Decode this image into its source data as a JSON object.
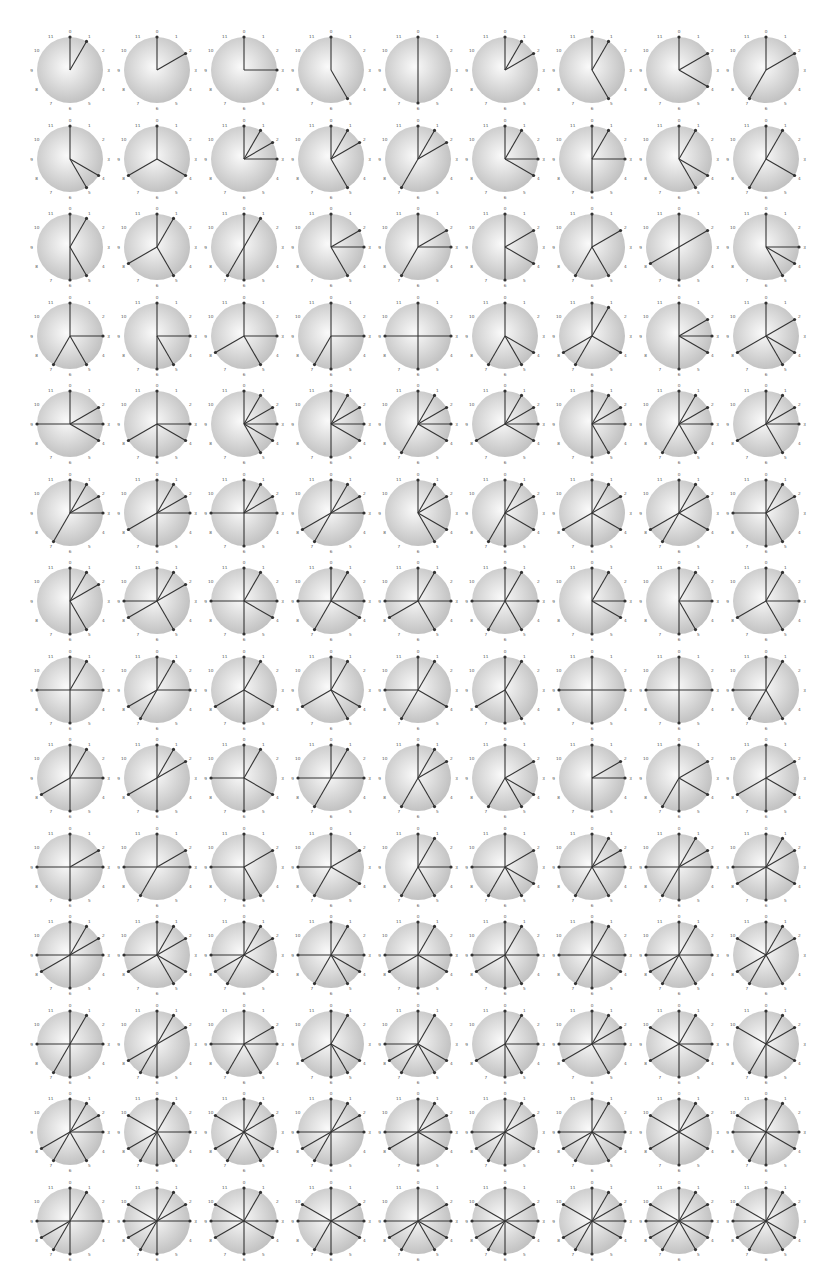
{
  "layout": {
    "columns": 9,
    "rows": 14,
    "first_center": [
      70,
      70
    ],
    "col_step": 87,
    "row_step": 88.5,
    "radius": 33
  },
  "colors": {
    "disc_center": "#fafafa",
    "disc_edge": "#bdbdbd",
    "spoke": "#333333",
    "label": "#555555"
  },
  "clock_labels": [
    "0",
    "1",
    "2",
    "3",
    "4",
    "5",
    "6",
    "7",
    "8",
    "9",
    "10",
    "11"
  ],
  "sets": [
    [
      0,
      1
    ],
    [
      0,
      2
    ],
    [
      0,
      3
    ],
    [
      0,
      5
    ],
    [
      0,
      6
    ],
    [
      0,
      1,
      2
    ],
    [
      0,
      1,
      5
    ],
    [
      0,
      2,
      4
    ],
    [
      0,
      2,
      7
    ],
    [
      0,
      4,
      5
    ],
    [
      0,
      4,
      8
    ],
    [
      0,
      1,
      2,
      3
    ],
    [
      0,
      1,
      2,
      5
    ],
    [
      0,
      1,
      2,
      7
    ],
    [
      0,
      1,
      3,
      4
    ],
    [
      0,
      1,
      3,
      6
    ],
    [
      0,
      1,
      4,
      5
    ],
    [
      0,
      1,
      4,
      7
    ],
    [
      0,
      1,
      5,
      6
    ],
    [
      0,
      1,
      5,
      8
    ],
    [
      0,
      1,
      6,
      7
    ],
    [
      0,
      2,
      3,
      5
    ],
    [
      0,
      2,
      3,
      7
    ],
    [
      0,
      2,
      4,
      6
    ],
    [
      0,
      2,
      5,
      7
    ],
    [
      0,
      2,
      6,
      8
    ],
    [
      0,
      3,
      4,
      5
    ],
    [
      0,
      3,
      5,
      7
    ],
    [
      0,
      3,
      5,
      6
    ],
    [
      0,
      3,
      5,
      8
    ],
    [
      0,
      3,
      6,
      7
    ],
    [
      0,
      3,
      6,
      9
    ],
    [
      0,
      4,
      5,
      7
    ],
    [
      0,
      1,
      4,
      7,
      8
    ],
    [
      0,
      2,
      3,
      4,
      6
    ],
    [
      0,
      2,
      4,
      5,
      8
    ],
    [
      0,
      2,
      3,
      4,
      9
    ],
    [
      0,
      3,
      4,
      6,
      8
    ],
    [
      0,
      1,
      2,
      3,
      4,
      5
    ],
    [
      0,
      1,
      2,
      3,
      4,
      6
    ],
    [
      0,
      1,
      2,
      3,
      4,
      7
    ],
    [
      0,
      1,
      2,
      3,
      4,
      8
    ],
    [
      0,
      1,
      2,
      3,
      5,
      6
    ],
    [
      0,
      1,
      2,
      3,
      5,
      7
    ],
    [
      0,
      1,
      2,
      3,
      5,
      8
    ],
    [
      0,
      1,
      2,
      3,
      7
    ],
    [
      0,
      1,
      2,
      3,
      6,
      8
    ],
    [
      0,
      1,
      2,
      3,
      6,
      9
    ],
    [
      0,
      1,
      2,
      3,
      7,
      8
    ],
    [
      0,
      1,
      2,
      4,
      5
    ],
    [
      0,
      1,
      2,
      4,
      6,
      7
    ],
    [
      0,
      1,
      2,
      4,
      6,
      8
    ],
    [
      0,
      1,
      2,
      4,
      7,
      8
    ],
    [
      0,
      1,
      2,
      5,
      6,
      9
    ],
    [
      0,
      1,
      2,
      5,
      6
    ],
    [
      0,
      1,
      2,
      5,
      8,
      9
    ],
    [
      0,
      1,
      3,
      4,
      6,
      9
    ],
    [
      0,
      1,
      3,
      4,
      7,
      9
    ],
    [
      0,
      1,
      3,
      5,
      8,
      9
    ],
    [
      0,
      1,
      3,
      5,
      7,
      9
    ],
    [
      0,
      1,
      3,
      4,
      6
    ],
    [
      0,
      1,
      3,
      5,
      6
    ],
    [
      0,
      1,
      3,
      5,
      8
    ],
    [
      0,
      1,
      3,
      6,
      9
    ],
    [
      0,
      1,
      3,
      7,
      8
    ],
    [
      0,
      1,
      4,
      6,
      8
    ],
    [
      0,
      1,
      4,
      5,
      8
    ],
    [
      0,
      1,
      4,
      7,
      9
    ],
    [
      0,
      1,
      5,
      6,
      8
    ],
    [
      0,
      3,
      6,
      9
    ],
    [
      0,
      3,
      6,
      9
    ],
    [
      0,
      1,
      5,
      7,
      9
    ],
    [
      0,
      1,
      3,
      6,
      8
    ],
    [
      0,
      1,
      2,
      6,
      8
    ],
    [
      0,
      1,
      4,
      6,
      9
    ],
    [
      0,
      1,
      3,
      7,
      9
    ],
    [
      0,
      1,
      2,
      5,
      7
    ],
    [
      0,
      2,
      4,
      5,
      7
    ],
    [
      0,
      2,
      3,
      6
    ],
    [
      0,
      2,
      4,
      6,
      7
    ],
    [
      0,
      2,
      4,
      6,
      8
    ],
    [
      0,
      2,
      3,
      6,
      9
    ],
    [
      0,
      2,
      3,
      7,
      9
    ],
    [
      0,
      2,
      5,
      6,
      9
    ],
    [
      0,
      2,
      4,
      7,
      9
    ],
    [
      0,
      1,
      3,
      5,
      7
    ],
    [
      0,
      2,
      4,
      5,
      7,
      9
    ],
    [
      0,
      1,
      2,
      3,
      5,
      7,
      9
    ],
    [
      0,
      1,
      2,
      3,
      6,
      7,
      9
    ],
    [
      0,
      1,
      2,
      4,
      6,
      8,
      9
    ],
    [
      0,
      1,
      2,
      3,
      6,
      8,
      9
    ],
    [
      0,
      1,
      2,
      4,
      5,
      8,
      9
    ],
    [
      0,
      1,
      2,
      4,
      7,
      8,
      9
    ],
    [
      0,
      1,
      3,
      4,
      5,
      7,
      9
    ],
    [
      0,
      1,
      3,
      4,
      6,
      8,
      9
    ],
    [
      0,
      1,
      3,
      5,
      6,
      8,
      9
    ],
    [
      0,
      1,
      3,
      4,
      6,
      7,
      9
    ],
    [
      0,
      1,
      3,
      5,
      7,
      8,
      9
    ],
    [
      0,
      1,
      2,
      5,
      7,
      8,
      10
    ],
    [
      0,
      1,
      3,
      6,
      7,
      9
    ],
    [
      0,
      1,
      2,
      6,
      7,
      8
    ],
    [
      0,
      2,
      3,
      5,
      7,
      9
    ],
    [
      0,
      1,
      4,
      5,
      6,
      8
    ],
    [
      0,
      1,
      4,
      5,
      7,
      8,
      9
    ],
    [
      0,
      1,
      3,
      5,
      6,
      8
    ],
    [
      0,
      1,
      2,
      3,
      5,
      8,
      9
    ],
    [
      0,
      1,
      3,
      4,
      6,
      8,
      10
    ],
    [
      0,
      1,
      2,
      4,
      6,
      7,
      10
    ],
    [
      0,
      1,
      2,
      3,
      5,
      7,
      8
    ],
    [
      0,
      1,
      3,
      5,
      6,
      7,
      8,
      10
    ],
    [
      0,
      1,
      2,
      4,
      5,
      7,
      8,
      10
    ],
    [
      0,
      1,
      2,
      3,
      6,
      7,
      8,
      9
    ],
    [
      0,
      1,
      2,
      3,
      4,
      6,
      8,
      9
    ],
    [
      0,
      1,
      2,
      4,
      6,
      7,
      8,
      9
    ],
    [
      0,
      1,
      3,
      4,
      5,
      7,
      8,
      9
    ],
    [
      0,
      1,
      2,
      4,
      6,
      8,
      10
    ],
    [
      0,
      1,
      3,
      4,
      6,
      7,
      9,
      10
    ],
    [
      0,
      1,
      3,
      6,
      7,
      8,
      9
    ],
    [
      0,
      1,
      2,
      3,
      6,
      7,
      8,
      9,
      10
    ],
    [
      0,
      1,
      3,
      4,
      6,
      8,
      9,
      10
    ],
    [
      0,
      2,
      3,
      4,
      6,
      7,
      9,
      10
    ],
    [
      0,
      2,
      3,
      4,
      5,
      7,
      8,
      9
    ],
    [
      0,
      2,
      3,
      4,
      6,
      7,
      8,
      9,
      10
    ],
    [
      0,
      1,
      2,
      3,
      4,
      6,
      7,
      8,
      10
    ],
    [
      0,
      1,
      2,
      3,
      4,
      5,
      7,
      8,
      9,
      10
    ],
    [
      0,
      1,
      2,
      4,
      5,
      7,
      8,
      9,
      10
    ]
  ]
}
